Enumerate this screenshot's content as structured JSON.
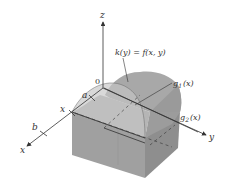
{
  "figure": {
    "axes": {
      "z_label": "z",
      "y_label": "y",
      "x_label": "x",
      "origin_label": "0"
    },
    "x_ticks": {
      "a": "a",
      "x": "x",
      "b": "b"
    },
    "annotations": {
      "k_label": "k(y) = f(x, y)",
      "g1_label": "g",
      "g1_sub": "1",
      "g1_arg": "(x)",
      "g2_label": "g",
      "g2_sub": "2",
      "g2_arg": "(x)"
    },
    "colors": {
      "solid_light": "#b8b8b8",
      "solid_mid": "#9e9e9e",
      "solid_dark": "#8a8a8a",
      "surface_top": "#a6a6a6",
      "cross_section": "#c2c2c2",
      "axis": "#333333"
    }
  }
}
